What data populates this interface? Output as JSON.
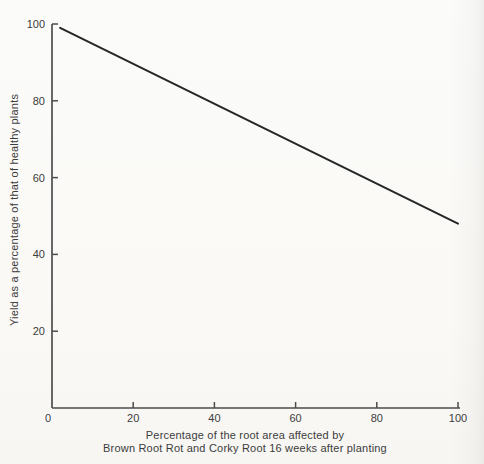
{
  "figure": {
    "background": "#faf9f6",
    "text_color": "#3c3c3c",
    "axis_color": "#4d4d4d",
    "line_color": "#262626"
  },
  "chart_data": {
    "type": "line",
    "title": "",
    "xlabel": [
      "Percentage of the root area affected by",
      "Brown Root Rot and Corky Root 16 weeks after planting"
    ],
    "ylabel": "Yield as a percentage of that of healthy plants",
    "xlim": [
      0,
      100
    ],
    "ylim": [
      0,
      100
    ],
    "x_ticks": [
      0,
      20,
      40,
      60,
      80,
      100
    ],
    "y_ticks": [
      0,
      20,
      40,
      60,
      80,
      100
    ],
    "grid": false,
    "legend": false,
    "series": [
      {
        "name": "yield vs root area affected",
        "x": [
          2,
          100
        ],
        "y": [
          99,
          48
        ]
      }
    ]
  }
}
